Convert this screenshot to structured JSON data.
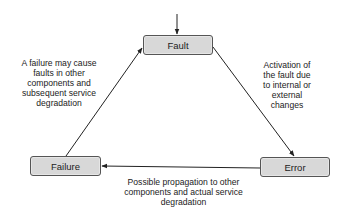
{
  "diagram": {
    "nodes": {
      "fault": {
        "label": "Fault"
      },
      "error": {
        "label": "Error"
      },
      "failure": {
        "label": "Failure"
      }
    },
    "edges": {
      "entry_to_fault": {
        "from": "external",
        "to": "Fault",
        "label": ""
      },
      "fault_to_error": {
        "from": "Fault",
        "to": "Error",
        "label_lines": [
          "Activation of",
          "the fault due",
          "to internal or",
          "external",
          "changes"
        ]
      },
      "error_to_failure": {
        "from": "Error",
        "to": "Failure",
        "label_lines": [
          "Possible propagation to other",
          "components and actual service",
          "degradation"
        ]
      },
      "failure_to_fault": {
        "from": "Failure",
        "to": "Fault",
        "label_lines": [
          "A failure may cause",
          "faults in other",
          "components and",
          "subsequent service",
          "degradation"
        ]
      }
    },
    "colors": {
      "node_fill": "#d8d8d8",
      "node_border": "#555555",
      "arrow": "#222222",
      "text": "#222222"
    }
  }
}
